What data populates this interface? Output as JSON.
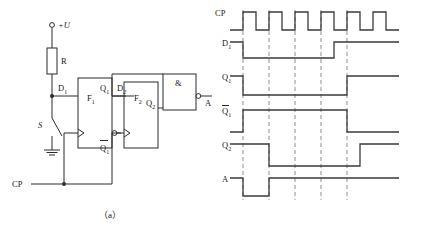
{
  "figure": {
    "caption_a": "（a）",
    "caption_b": "（b）"
  },
  "circuit": {
    "supply_label": "+U",
    "resistor_label": "R",
    "switch_label": "S",
    "clock_label": "CP",
    "ff1_label": "F",
    "ff1_sub": "1",
    "ff2_label": "F",
    "ff2_sub": "2",
    "d1_label": "D",
    "d1_sub": "1",
    "q1_label": "Q",
    "q1_sub": "1",
    "q1bar_label": "Q",
    "q1bar_sub": "1",
    "d2_label": "D",
    "d2_sub": "2",
    "q2_label": "Q",
    "q2_sub": "2",
    "gate_label": "&",
    "output_label": "A"
  },
  "timing": {
    "row_labels": [
      {
        "base": "CP",
        "sub": "",
        "overbar": false
      },
      {
        "base": "D",
        "sub": "1",
        "overbar": false
      },
      {
        "base": "Q",
        "sub": "1",
        "overbar": false
      },
      {
        "base": "Q",
        "sub": "1",
        "overbar": true
      },
      {
        "base": "Q",
        "sub": "2",
        "overbar": false
      },
      {
        "base": "A",
        "sub": "",
        "overbar": false
      }
    ],
    "marker_count": 5,
    "clock_pulse_count": 6
  },
  "chart_data": {
    "type": "line",
    "xlabel": "",
    "ylabel": "",
    "x_unit_px": 26,
    "x_start_px": 230,
    "markers_px": [
      243,
      269,
      295,
      321,
      347
    ],
    "series": [
      {
        "name": "CP",
        "label": "CP",
        "row_top_px": 12,
        "row_high_px": 12,
        "row_low_px": 30,
        "points": [
          [
            230,
            0
          ],
          [
            243,
            0
          ],
          [
            243,
            1
          ],
          [
            256,
            1
          ],
          [
            256,
            0
          ],
          [
            269,
            0
          ],
          [
            269,
            1
          ],
          [
            282,
            1
          ],
          [
            282,
            0
          ],
          [
            295,
            0
          ],
          [
            295,
            1
          ],
          [
            308,
            1
          ],
          [
            308,
            0
          ],
          [
            321,
            0
          ],
          [
            321,
            1
          ],
          [
            334,
            1
          ],
          [
            334,
            0
          ],
          [
            347,
            0
          ],
          [
            347,
            1
          ],
          [
            360,
            1
          ],
          [
            360,
            0
          ],
          [
            373,
            0
          ],
          [
            373,
            1
          ],
          [
            386,
            1
          ],
          [
            386,
            0
          ],
          [
            399,
            0
          ]
        ]
      },
      {
        "name": "D1",
        "label": "D1",
        "row_top_px": 42,
        "row_high_px": 42,
        "row_low_px": 58,
        "points": [
          [
            230,
            1
          ],
          [
            243,
            1
          ],
          [
            243,
            0
          ],
          [
            334,
            0
          ],
          [
            334,
            1
          ],
          [
            399,
            1
          ]
        ]
      },
      {
        "name": "Q1",
        "label": "Q1",
        "row_top_px": 76,
        "row_high_px": 76,
        "row_low_px": 95,
        "points": [
          [
            230,
            1
          ],
          [
            243,
            1
          ],
          [
            243,
            0
          ],
          [
            347,
            0
          ],
          [
            347,
            1
          ],
          [
            399,
            1
          ]
        ]
      },
      {
        "name": "Q1bar",
        "label": "Q1bar",
        "row_top_px": 110,
        "row_high_px": 110,
        "row_low_px": 132,
        "points": [
          [
            230,
            0
          ],
          [
            243,
            0
          ],
          [
            243,
            1
          ],
          [
            347,
            1
          ],
          [
            347,
            0
          ],
          [
            399,
            0
          ]
        ]
      },
      {
        "name": "Q2",
        "label": "Q2",
        "row_top_px": 144,
        "row_high_px": 144,
        "row_low_px": 166,
        "points": [
          [
            230,
            1
          ],
          [
            269,
            1
          ],
          [
            269,
            0
          ],
          [
            360,
            0
          ],
          [
            360,
            1
          ],
          [
            399,
            1
          ]
        ]
      },
      {
        "name": "A",
        "label": "A",
        "row_top_px": 178,
        "row_high_px": 178,
        "row_low_px": 196,
        "points": [
          [
            230,
            1
          ],
          [
            243,
            1
          ],
          [
            243,
            0
          ],
          [
            269,
            0
          ],
          [
            269,
            1
          ],
          [
            399,
            1
          ]
        ]
      }
    ],
    "grid": false,
    "legend": "none"
  }
}
